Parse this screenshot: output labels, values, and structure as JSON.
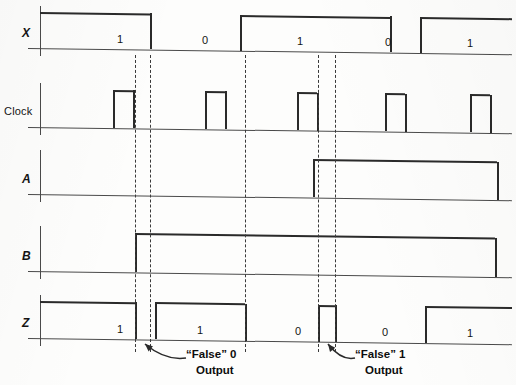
{
  "figure": {
    "type": "timing-diagram"
  },
  "rows": [
    {
      "id": "x",
      "label": "X",
      "italic": true,
      "y_top": 12,
      "y_base": 48
    },
    {
      "id": "clock",
      "label": "Clock",
      "italic": false,
      "y_top": 89,
      "y_base": 127
    },
    {
      "id": "a",
      "label": "A",
      "italic": true,
      "y_top": 156,
      "y_base": 194
    },
    {
      "id": "b",
      "label": "B",
      "italic": true,
      "y_top": 232,
      "y_base": 271
    },
    {
      "id": "z",
      "label": "Z",
      "italic": true,
      "y_top": 301,
      "y_base": 338
    }
  ],
  "waveforms": {
    "x": {
      "name": "X",
      "levels": [
        {
          "from": 40,
          "to": 150,
          "state": 1
        },
        {
          "from": 150,
          "to": 240,
          "state": 0
        },
        {
          "from": 240,
          "to": 390,
          "state": 1
        },
        {
          "from": 390,
          "to": 420,
          "state": 0
        },
        {
          "from": 420,
          "to": 512,
          "state": 1
        }
      ],
      "bit_labels": [
        {
          "text": "1",
          "x": 120
        },
        {
          "text": "0",
          "x": 205
        },
        {
          "text": "1",
          "x": 300
        },
        {
          "text": "0",
          "x": 388
        },
        {
          "text": "1",
          "x": 470
        }
      ]
    },
    "clock": {
      "name": "Clock",
      "pulses": [
        {
          "from": 113,
          "to": 133
        },
        {
          "from": 205,
          "to": 225
        },
        {
          "from": 297,
          "to": 317
        },
        {
          "from": 385,
          "to": 405
        },
        {
          "from": 470,
          "to": 490
        }
      ]
    },
    "a": {
      "name": "A",
      "levels": [
        {
          "from": 40,
          "to": 313,
          "state": 0
        },
        {
          "from": 313,
          "to": 497,
          "state": 1
        },
        {
          "from": 497,
          "to": 512,
          "state": 0
        }
      ]
    },
    "b": {
      "name": "B",
      "levels": [
        {
          "from": 40,
          "to": 135,
          "state": 0
        },
        {
          "from": 135,
          "to": 495,
          "state": 1
        },
        {
          "from": 495,
          "to": 512,
          "state": 0
        }
      ]
    },
    "z": {
      "name": "Z",
      "levels": [
        {
          "from": 40,
          "to": 135,
          "state": 1
        },
        {
          "from": 135,
          "to": 155,
          "state": 0
        },
        {
          "from": 155,
          "to": 245,
          "state": 1
        },
        {
          "from": 245,
          "to": 318,
          "state": 0
        },
        {
          "from": 318,
          "to": 335,
          "state": 1
        },
        {
          "from": 335,
          "to": 425,
          "state": 0
        },
        {
          "from": 425,
          "to": 512,
          "state": 1
        }
      ],
      "bit_labels": [
        {
          "text": "1",
          "x": 120
        },
        {
          "text": "1",
          "x": 200
        },
        {
          "text": "0",
          "x": 298
        },
        {
          "text": "0",
          "x": 385
        },
        {
          "text": "1",
          "x": 470
        }
      ]
    }
  },
  "dashed_lines": [
    {
      "x": 135,
      "y_from": 55,
      "y_to": 352
    },
    {
      "x": 150,
      "y_from": 55,
      "y_to": 352
    },
    {
      "x": 245,
      "y_from": 55,
      "y_to": 352
    },
    {
      "x": 318,
      "y_from": 55,
      "y_to": 352
    },
    {
      "x": 335,
      "y_from": 55,
      "y_to": 352
    }
  ],
  "annotations": [
    {
      "id": "false-zero",
      "line1": "“False” 0",
      "line2": "Output",
      "text_x": 186,
      "text_y": 352,
      "arrow_from_x": 186,
      "arrow_from_y": 358,
      "arrow_to_x": 145,
      "arrow_to_y": 344
    },
    {
      "id": "false-one",
      "line1": "“False” 1",
      "line2": "Output",
      "text_x": 355,
      "text_y": 352,
      "arrow_from_x": 355,
      "arrow_from_y": 358,
      "arrow_to_x": 328,
      "arrow_to_y": 344
    }
  ],
  "colors": {
    "ink": "#2a2a2a",
    "axis": "#4a4a4a",
    "paper": "#fdfdfc",
    "dash": "#3a3a3a"
  }
}
